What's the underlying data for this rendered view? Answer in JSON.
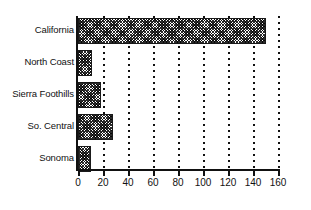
{
  "chart_data": {
    "type": "bar",
    "orientation": "horizontal",
    "title": "",
    "subtitle": "",
    "xlabel": "",
    "ylabel": "",
    "categories": [
      "California",
      "North Coast",
      "Sierra Foothills",
      "So. Central",
      "Sonoma"
    ],
    "values": [
      150,
      11,
      18,
      28,
      10
    ],
    "series": [
      {
        "name": "",
        "values": [
          150,
          11,
          18,
          28,
          10
        ]
      }
    ],
    "xlim": [
      0,
      160
    ],
    "xticks": [
      0,
      20,
      40,
      60,
      80,
      100,
      120,
      140,
      160
    ],
    "xtick_labels": [
      "0",
      "20",
      "40",
      "60",
      "80",
      "100",
      "120",
      "140",
      "160"
    ],
    "grid": "vertical-dotted",
    "legend": "none",
    "bar_fill": "checkerboard-dither",
    "colors": {
      "bar_fill": "#2b2b2b",
      "bar_border": "#1a1a1a",
      "axis": "#111111",
      "gridline": "#111111",
      "background": "#ffffff",
      "text": "#111111"
    }
  }
}
